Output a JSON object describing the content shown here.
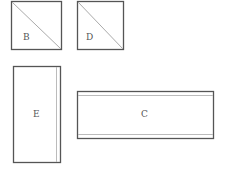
{
  "diagram": {
    "pieces": [
      {
        "id": "B",
        "label": "B",
        "shape": "square-with-diagonal"
      },
      {
        "id": "D",
        "label": "D",
        "shape": "square-with-diagonal"
      },
      {
        "id": "E",
        "label": "E",
        "shape": "tall-rectangle-with-right-strip"
      },
      {
        "id": "C",
        "label": "C",
        "shape": "wide-rectangle-with-top-bottom-strips"
      }
    ],
    "colors": {
      "line": "#555555",
      "inner_line": "#bbbbbb",
      "background": "#ffffff"
    }
  }
}
